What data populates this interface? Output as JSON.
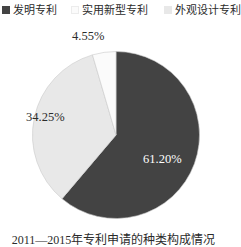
{
  "chart_data": {
    "type": "pie",
    "title": "",
    "categories": [
      "发明专利",
      "实用新型专利",
      "外观设计专利"
    ],
    "values": [
      61.2,
      34.25,
      4.55
    ],
    "value_labels": [
      "61.20%",
      "34.25%",
      "4.55%"
    ],
    "unit": "%",
    "legend_position": "top",
    "grid": false,
    "start_angle_deg": 0,
    "direction": "clockwise",
    "slice_colors": [
      "#434343",
      "#e8e8e8",
      "#fbfbfb"
    ],
    "slice_label_colors": [
      "#ffffff",
      "#2b2b2b",
      "#2b2b2b"
    ],
    "slices": [
      {
        "name": "发明专利",
        "value": 61.2,
        "label": "61.20%",
        "color": "#434343",
        "label_color": "#ffffff"
      },
      {
        "name": "外观设计专利",
        "value": 34.25,
        "label": "34.25%",
        "color": "#e8e8e8",
        "label_color": "#2b2b2b"
      },
      {
        "name": "实用新型专利",
        "value": 4.55,
        "label": "4.55%",
        "color": "#fbfbfb",
        "label_color": "#2b2b2b"
      }
    ]
  },
  "legend": {
    "items": [
      {
        "label": "发明专利",
        "color": "#434343"
      },
      {
        "label": "实用新型专利",
        "color": "#fbfbfb"
      },
      {
        "label": "外观设计专利",
        "color": "#e8e8e8"
      }
    ]
  },
  "labels": {
    "top": "4.55%",
    "left": "34.25%",
    "right": "61.20%"
  },
  "caption": {
    "text": "2011—2015年专利申请的种类构成情况"
  },
  "colors": {
    "slice_dark": "#434343",
    "slice_light": "#e8e8e8",
    "slice_white": "#fbfbfb",
    "outline": "#c9c9c9",
    "text": "#2b2b2b",
    "text_inverse": "#ffffff",
    "background": "#ffffff"
  }
}
